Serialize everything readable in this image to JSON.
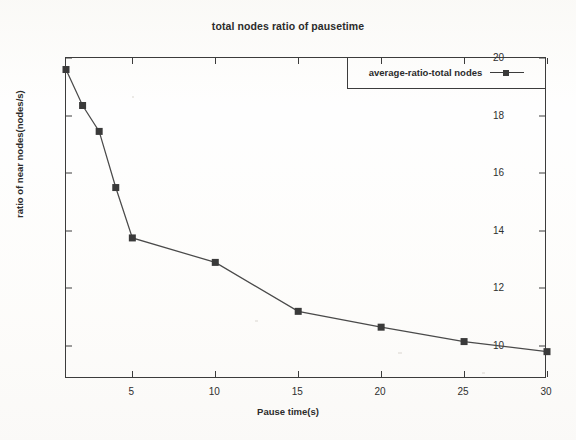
{
  "chart_data": {
    "type": "line",
    "title": "total nodes ratio of pausetime",
    "xlabel": "Pause time(s)",
    "ylabel": "ratio of near nodes(nodes/s)",
    "xlim": [
      1,
      30
    ],
    "ylim": [
      8.85,
      20
    ],
    "grid": false,
    "legend_position": "top-right",
    "xticks": [
      5,
      10,
      15,
      20,
      25,
      30
    ],
    "xtick_labels": [
      "5",
      "10",
      "15",
      "20",
      "25",
      "30"
    ],
    "yticks": [
      10,
      12,
      14,
      16,
      18,
      20
    ],
    "ytick_labels": [
      "10",
      "12",
      "14",
      "16",
      "18",
      "20"
    ],
    "x": [
      1,
      2,
      3,
      4,
      5,
      10,
      15,
      20,
      25,
      30
    ],
    "series": [
      {
        "name": "average-ratio-total nodes",
        "marker": "square",
        "color": "#3a3a3a",
        "values": [
          19.6,
          18.35,
          17.45,
          15.5,
          13.75,
          12.9,
          11.2,
          10.65,
          10.15,
          9.8
        ]
      }
    ]
  },
  "legend": {
    "entries": [
      {
        "label": "average-ratio-total nodes"
      }
    ]
  },
  "colors": {
    "line": "#4a4a4a",
    "marker": "#3a3a3a",
    "axis": "#3c3c3c",
    "text": "#2b2b2b",
    "background": "#fdfdfc"
  }
}
